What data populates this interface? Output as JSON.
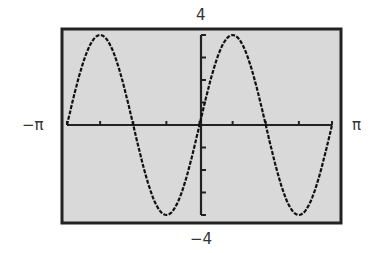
{
  "chart_data": {
    "type": "line",
    "title": "",
    "function": "y = 4 sin(2x)",
    "xlabel": "",
    "ylabel": "",
    "xlim": [
      -3.14159,
      3.14159
    ],
    "ylim": [
      -4,
      4
    ],
    "x_tick_step": "pi/4",
    "y_tick_step": 1,
    "grid": false,
    "legend": null,
    "labels": {
      "xmin": "−π",
      "xmax": "π",
      "ymax": "4",
      "ymin": "−4"
    },
    "series": [
      {
        "name": "4 sin(2x)",
        "x": [
          -3.1416,
          -2.7489,
          -2.3562,
          -1.9635,
          -1.5708,
          -1.1781,
          -0.7854,
          -0.3927,
          0,
          0.3927,
          0.7854,
          1.1781,
          1.5708,
          1.9635,
          2.3562,
          2.7489,
          3.1416
        ],
        "values": [
          0,
          2.83,
          4,
          2.83,
          0,
          -2.83,
          -4,
          -2.83,
          0,
          2.83,
          4,
          2.83,
          0,
          -2.83,
          -4,
          -2.83,
          0
        ]
      }
    ],
    "colors": {
      "background": "#d9d9d9",
      "frame": "#222222",
      "curve": "#111111"
    }
  }
}
